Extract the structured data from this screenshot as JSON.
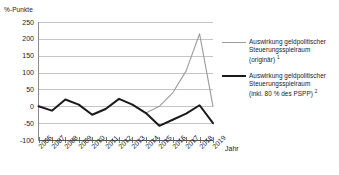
{
  "chart_data": {
    "type": "line",
    "title": "",
    "ylabel": "%-Punkte",
    "xlabel": "Jahr",
    "ylim": [
      -100,
      250
    ],
    "ytick_step": 50,
    "grid": true,
    "legend_position": "right",
    "yticks": [
      "250",
      "200",
      "150",
      "100",
      "50",
      "0",
      "-50",
      "-100"
    ],
    "categories": [
      "2006",
      "2007",
      "2008",
      "2009",
      "2010",
      "2011",
      "2012",
      "2013",
      "2014",
      "2015",
      "2016",
      "2017",
      "2018",
      "2019"
    ],
    "series": [
      {
        "name": "Auswirkung geldpolitischer Steuerungsspielraum (originär)",
        "color": "#9b9b9b",
        "width": 1.1,
        "values": [
          null,
          null,
          null,
          null,
          null,
          null,
          null,
          null,
          -20,
          0,
          40,
          105,
          215,
          0
        ]
      },
      {
        "name": "Auswirkung geldpolitischer Steuerungsspielraum (inkl. 80 % des PSPP)",
        "color": "#1a1a1a",
        "width": 2.0,
        "values": [
          0,
          -13,
          20,
          5,
          -25,
          -8,
          22,
          5,
          -20,
          -58,
          -40,
          -22,
          3,
          -50
        ]
      }
    ]
  },
  "axis": {
    "y_caption": "%-Punkte",
    "x_caption": "Jahr"
  },
  "legend": {
    "entries": [
      {
        "color": "#9b9b9b",
        "line1": "Auswirkung geldpolitischer",
        "line2": "Steuerungsspielraum",
        "line3": "(originär)",
        "footnote": "1"
      },
      {
        "color": "#1a1a1a",
        "line1": "Auswirkung geldpolitischer",
        "line2": "Steuerungsspielraum",
        "line3": "(inkl. 80 % des PSPP)",
        "footnote": "2"
      }
    ]
  }
}
